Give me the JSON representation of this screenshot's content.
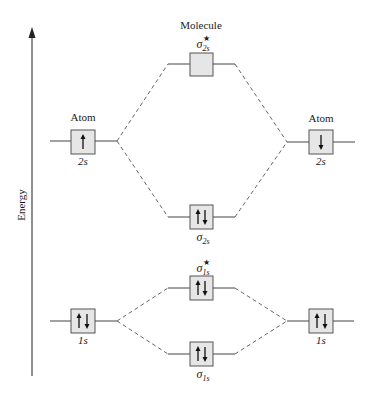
{
  "diagram": {
    "title": "Molecule",
    "axis": {
      "label": "Energy",
      "direction": "up"
    },
    "left_atom": {
      "label": "Atom",
      "orbitals": [
        {
          "name": "2s",
          "electrons": "up",
          "electron_count": 1
        },
        {
          "name": "1s",
          "electrons": "up-down",
          "electron_count": 2
        }
      ]
    },
    "right_atom": {
      "label": "Atom",
      "orbitals": [
        {
          "name": "2s",
          "electrons": "down",
          "electron_count": 1
        },
        {
          "name": "1s",
          "electrons": "up-down",
          "electron_count": 2
        }
      ]
    },
    "molecular_orbitals": [
      {
        "id": "sigma_2s_star",
        "symbol": "σ",
        "subscript": "2s",
        "antibonding": true,
        "star": "★",
        "electrons": "empty",
        "electron_count": 0
      },
      {
        "id": "sigma_2s",
        "symbol": "σ",
        "subscript": "2s",
        "antibonding": false,
        "star": "",
        "electrons": "up-down",
        "electron_count": 2
      },
      {
        "id": "sigma_1s_star",
        "symbol": "σ",
        "subscript": "1s",
        "antibonding": true,
        "star": "★",
        "electrons": "up-down",
        "electron_count": 2
      },
      {
        "id": "sigma_1s",
        "symbol": "σ",
        "subscript": "1s",
        "antibonding": false,
        "star": "",
        "electrons": "up-down",
        "electron_count": 2
      }
    ],
    "colors": {
      "box_fill": "#e6e6e6",
      "line": "#444444",
      "dash": "#555555"
    }
  }
}
